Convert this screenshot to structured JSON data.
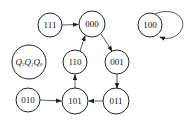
{
  "diagram": {
    "type": "state-transition",
    "legend": {
      "label": "Q2Q1Q0",
      "display": "Q₂Q₁Q₀"
    },
    "states": [
      {
        "id": "s111",
        "label": "111",
        "cx": 50,
        "cy": 25,
        "r": 12
      },
      {
        "id": "s000",
        "label": "000",
        "cx": 92,
        "cy": 24,
        "r": 13
      },
      {
        "id": "s100",
        "label": "100",
        "cx": 150,
        "cy": 25,
        "r": 12
      },
      {
        "id": "s110",
        "label": "110",
        "cx": 75,
        "cy": 62,
        "r": 12
      },
      {
        "id": "s001",
        "label": "001",
        "cx": 117,
        "cy": 62,
        "r": 12
      },
      {
        "id": "s010",
        "label": "010",
        "cx": 28,
        "cy": 100,
        "r": 12
      },
      {
        "id": "s101",
        "label": "101",
        "cx": 75,
        "cy": 101,
        "r": 13
      },
      {
        "id": "s011",
        "label": "011",
        "cx": 116,
        "cy": 101,
        "r": 13
      }
    ],
    "transitions": [
      {
        "from": "111",
        "to": "000"
      },
      {
        "from": "000",
        "to": "001"
      },
      {
        "from": "001",
        "to": "011"
      },
      {
        "from": "011",
        "to": "101"
      },
      {
        "from": "101",
        "to": "110"
      },
      {
        "from": "110",
        "to": "000"
      },
      {
        "from": "010",
        "to": "101"
      },
      {
        "from": "100",
        "to": "100"
      }
    ]
  }
}
